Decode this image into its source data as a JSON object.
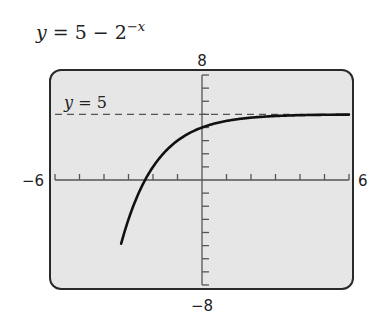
{
  "chart_data": {
    "type": "line",
    "title_parts": {
      "lhs": "y",
      "eq": " = 5 − 2",
      "exp": "−x"
    },
    "function": "5 - 2^(-x)",
    "xlim": [
      -6,
      6
    ],
    "ylim": [
      -8,
      8
    ],
    "x_tick_step": 1,
    "y_tick_step": 1,
    "tick_labels": {
      "xmin": "−6",
      "xmax": "6",
      "ymin": "−8",
      "ymax": "8"
    },
    "xlabel": "",
    "ylabel": "",
    "grid": false,
    "asymptote": {
      "y": 5,
      "label": "y = 5",
      "label_var": "y",
      "label_rest": " = 5",
      "style": "dashed"
    },
    "series": [
      {
        "name": "y = 5 − 2^(−x)",
        "x": [
          -3.3,
          -3,
          -2.5,
          -2.32,
          -2,
          -1.5,
          -1,
          -0.5,
          0,
          1,
          2,
          3,
          4,
          5,
          6
        ],
        "y": [
          -4.85,
          -3,
          -0.66,
          0,
          1,
          2.17,
          3,
          3.59,
          4,
          4.5,
          4.75,
          4.875,
          4.94,
          4.97,
          4.98
        ]
      }
    ],
    "key_points": {
      "y_intercept": [
        0,
        4
      ],
      "x_intercept": [
        -2.32,
        0
      ]
    }
  },
  "colors": {
    "background": "#ffffff",
    "screen": "#e6e6e6",
    "frame": "#2a2a2a",
    "curve": "#111111",
    "axis": "#555555",
    "asymptote": "#555555",
    "text": "#222222"
  }
}
